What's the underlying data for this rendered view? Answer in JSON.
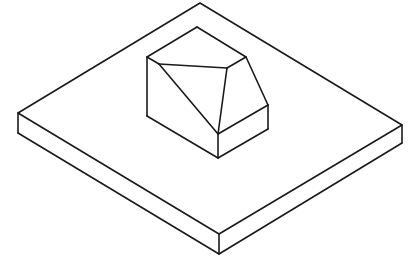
{
  "diagram": {
    "type": "isometric-technical-drawing",
    "background": "#ffffff",
    "stroke_color": "#1a1a1a",
    "stroke_width": 1.6,
    "objects": [
      {
        "name": "base-plate",
        "top_face": [
          [
            200,
            3
          ],
          [
            402,
            125
          ],
          [
            219,
            234
          ],
          [
            18,
            113
          ]
        ],
        "edges": [
          [
            [
              18,
              113
            ],
            [
              18,
              133
            ]
          ],
          [
            [
              18,
              133
            ],
            [
              219,
              254
            ]
          ],
          [
            [
              219,
              234
            ],
            [
              219,
              254
            ]
          ],
          [
            [
              219,
              254
            ],
            [
              402,
              143
            ]
          ],
          [
            [
              402,
              125
            ],
            [
              402,
              143
            ]
          ]
        ]
      },
      {
        "name": "chamfered-block",
        "edges": [
          [
            [
              147,
              57
            ],
            [
              197,
              27
            ]
          ],
          [
            [
              197,
              27
            ],
            [
              246,
              57
            ]
          ],
          [
            [
              147,
              57
            ],
            [
              159,
              64
            ]
          ],
          [
            [
              159,
              64
            ],
            [
              227,
              68
            ]
          ],
          [
            [
              227,
              68
            ],
            [
              246,
              57
            ]
          ],
          [
            [
              147,
              57
            ],
            [
              147,
              116
            ]
          ],
          [
            [
              147,
              116
            ],
            [
              218,
              158
            ]
          ],
          [
            [
              159,
              64
            ],
            [
              218,
              134
            ]
          ],
          [
            [
              227,
              68
            ],
            [
              218,
              134
            ]
          ],
          [
            [
              246,
              57
            ],
            [
              268,
              105
            ]
          ],
          [
            [
              268,
              105
            ],
            [
              218,
              134
            ]
          ],
          [
            [
              218,
              134
            ],
            [
              218,
              158
            ]
          ],
          [
            [
              268,
              105
            ],
            [
              268,
              129
            ]
          ],
          [
            [
              268,
              129
            ],
            [
              218,
              158
            ]
          ]
        ]
      }
    ]
  }
}
